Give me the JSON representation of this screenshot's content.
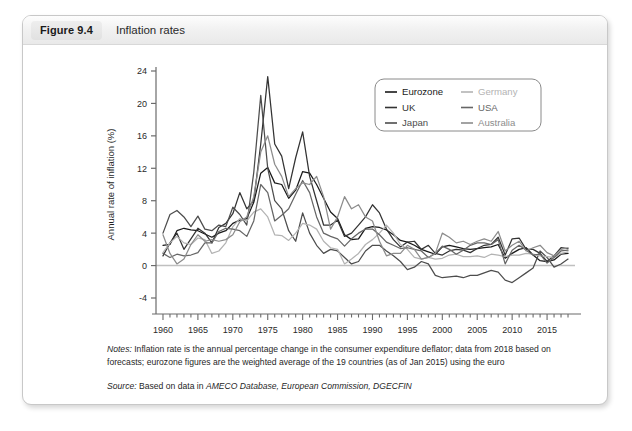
{
  "figure": {
    "badge": "Figure 9.4",
    "title": "Inflation rates"
  },
  "notes": {
    "label": "Notes:",
    "text_part1": " Inflation rate is the annual percentage change in the consumer expenditure deflator; data from 2018 based on forecasts; eurozone figures are the weighted average of the 19 countries (as of Jan 2015) using the euro",
    "source_label": "Source:",
    "source_plain": " Based on data in ",
    "source_italic": "AMECO Database, European Commission, DGECFIN"
  },
  "chart_data": {
    "type": "line",
    "title": "Inflation rates",
    "xlabel": "",
    "ylabel": "Annual rate of inflation (%)",
    "xlim": [
      1959,
      2019
    ],
    "ylim": [
      -4,
      24
    ],
    "yticks": [
      -4,
      0,
      4,
      8,
      12,
      16,
      20,
      24
    ],
    "xticks": [
      1960,
      1965,
      1970,
      1975,
      1980,
      1985,
      1990,
      1995,
      2000,
      2005,
      2010,
      2015
    ],
    "xtick_labels": [
      "1960",
      "1965",
      "1970",
      "1975",
      "1980",
      "1985",
      "1990",
      "1995",
      "2000",
      "2005",
      "2010",
      "2015"
    ],
    "ytick_labels": [
      "-4",
      "0",
      "4",
      "8",
      "12",
      "16",
      "20",
      "24"
    ],
    "minor_x_step": 1,
    "grid": false,
    "zero_line": true,
    "legend_position": "top-right",
    "x": [
      1960,
      1961,
      1962,
      1963,
      1964,
      1965,
      1966,
      1967,
      1968,
      1969,
      1970,
      1971,
      1972,
      1973,
      1974,
      1975,
      1976,
      1977,
      1978,
      1979,
      1980,
      1981,
      1982,
      1983,
      1984,
      1985,
      1986,
      1987,
      1988,
      1989,
      1990,
      1991,
      1992,
      1993,
      1994,
      1995,
      1996,
      1997,
      1998,
      1999,
      2000,
      2001,
      2002,
      2003,
      2004,
      2005,
      2006,
      2007,
      2008,
      2009,
      2010,
      2011,
      2012,
      2013,
      2014,
      2015,
      2016,
      2017,
      2018
    ],
    "series": [
      {
        "name": "Eurozone",
        "color": "#1a1a1a",
        "width": 1.25,
        "values": [
          2.5,
          2.6,
          4.3,
          4.6,
          4.4,
          4.3,
          3.9,
          3.5,
          4.0,
          4.3,
          5.2,
          5.6,
          5.8,
          7.8,
          11.4,
          12.1,
          10.2,
          10.0,
          8.3,
          9.3,
          11.6,
          11.4,
          10.0,
          8.3,
          6.6,
          5.8,
          3.8,
          3.2,
          3.3,
          4.6,
          4.8,
          4.7,
          4.4,
          3.8,
          3.1,
          2.9,
          2.5,
          2.0,
          1.7,
          1.4,
          2.3,
          2.5,
          2.3,
          2.1,
          2.0,
          2.1,
          2.2,
          2.3,
          2.6,
          0.9,
          1.5,
          2.0,
          2.2,
          1.3,
          0.6,
          0.5,
          0.7,
          1.4,
          1.5
        ]
      },
      {
        "name": "UK",
        "color": "#333333",
        "width": 1.25,
        "values": [
          1.2,
          2.8,
          4.0,
          2.0,
          3.3,
          4.6,
          4.0,
          2.8,
          4.7,
          5.2,
          6.4,
          9.0,
          7.0,
          8.0,
          15.0,
          23.3,
          15.0,
          13.5,
          9.5,
          13.3,
          16.5,
          11.0,
          8.0,
          5.0,
          5.0,
          5.6,
          3.6,
          4.0,
          5.0,
          6.0,
          7.5,
          6.5,
          4.5,
          3.2,
          2.3,
          2.9,
          3.0,
          2.0,
          2.5,
          1.5,
          1.3,
          1.8,
          2.0,
          1.9,
          1.6,
          2.1,
          2.5,
          2.6,
          3.5,
          1.3,
          3.3,
          3.4,
          2.0,
          2.0,
          1.5,
          0.5,
          1.2,
          2.2,
          2.1
        ]
      },
      {
        "name": "Japan",
        "color": "#4d4d4d",
        "width": 1.25,
        "values": [
          4.0,
          6.3,
          6.8,
          6.0,
          4.8,
          6.1,
          4.5,
          4.3,
          5.0,
          4.8,
          7.2,
          6.3,
          5.0,
          11.5,
          21.0,
          12.0,
          8.0,
          7.0,
          4.3,
          3.0,
          6.5,
          4.0,
          2.5,
          1.5,
          2.0,
          1.8,
          1.0,
          0.2,
          0.5,
          1.8,
          2.5,
          2.5,
          1.8,
          1.2,
          0.5,
          -0.5,
          -0.2,
          0.5,
          0.2,
          -1.2,
          -1.5,
          -1.4,
          -1.3,
          -1.5,
          -1.2,
          -1.2,
          -0.9,
          -0.6,
          -0.8,
          -1.8,
          -2.1,
          -1.5,
          -0.9,
          -0.3,
          1.8,
          1.0,
          -0.2,
          0.2,
          0.8
        ]
      },
      {
        "name": "Germany",
        "color": "#b3b3b3",
        "width": 1.25,
        "values": [
          1.6,
          2.8,
          3.6,
          2.8,
          2.6,
          3.4,
          3.2,
          1.5,
          1.8,
          2.8,
          4.8,
          5.8,
          5.5,
          6.6,
          7.0,
          6.0,
          3.8,
          3.7,
          3.1,
          4.0,
          5.2,
          5.0,
          4.5,
          3.0,
          2.2,
          2.0,
          0.2,
          0.8,
          1.5,
          2.6,
          3.2,
          4.0,
          5.0,
          4.0,
          2.6,
          2.0,
          1.0,
          0.8,
          1.0,
          0.8,
          0.9,
          1.3,
          1.4,
          1.1,
          1.1,
          1.2,
          1.0,
          1.4,
          1.3,
          1.1,
          1.3,
          1.3,
          1.5,
          1.4,
          1.2,
          1.1,
          1.0,
          1.5,
          1.7
        ]
      },
      {
        "name": "USA",
        "color": "#666666",
        "width": 1.25,
        "values": [
          1.5,
          1.0,
          1.4,
          1.2,
          1.3,
          1.6,
          2.8,
          2.8,
          4.2,
          4.6,
          4.5,
          4.3,
          3.6,
          5.5,
          10.0,
          9.0,
          5.5,
          6.2,
          7.0,
          8.8,
          10.5,
          9.0,
          6.0,
          4.0,
          3.6,
          3.3,
          2.4,
          3.3,
          4.0,
          4.5,
          4.5,
          3.8,
          2.9,
          2.5,
          2.1,
          2.2,
          2.0,
          1.8,
          1.0,
          1.5,
          2.4,
          2.0,
          1.4,
          1.9,
          2.5,
          2.8,
          2.8,
          2.6,
          3.2,
          0.2,
          1.9,
          2.5,
          1.9,
          1.3,
          1.4,
          0.3,
          1.0,
          1.8,
          1.9
        ]
      },
      {
        "name": "Australia",
        "color": "#8c8c8c",
        "width": 1.25,
        "values": [
          3.8,
          1.5,
          0.2,
          0.8,
          2.6,
          3.8,
          3.0,
          3.2,
          3.0,
          3.2,
          3.8,
          5.4,
          6.0,
          8.5,
          14.0,
          16.0,
          12.5,
          11.0,
          8.5,
          9.5,
          10.2,
          10.0,
          11.0,
          8.5,
          4.5,
          6.0,
          8.5,
          7.0,
          7.5,
          6.0,
          5.5,
          3.0,
          1.2,
          1.5,
          1.5,
          2.5,
          2.0,
          0.8,
          1.0,
          1.5,
          4.0,
          3.5,
          2.8,
          3.0,
          2.6,
          3.0,
          3.3,
          3.0,
          4.2,
          1.8,
          2.5,
          3.0,
          1.8,
          2.2,
          2.5,
          1.6,
          1.2,
          2.0,
          2.2
        ]
      }
    ],
    "legend": [
      {
        "name": "Eurozone",
        "color": "#1a1a1a"
      },
      {
        "name": "Germany",
        "color": "#b3b3b3"
      },
      {
        "name": "UK",
        "color": "#333333"
      },
      {
        "name": "USA",
        "color": "#666666"
      },
      {
        "name": "Japan",
        "color": "#4d4d4d"
      },
      {
        "name": "Australia",
        "color": "#8c8c8c"
      }
    ]
  }
}
